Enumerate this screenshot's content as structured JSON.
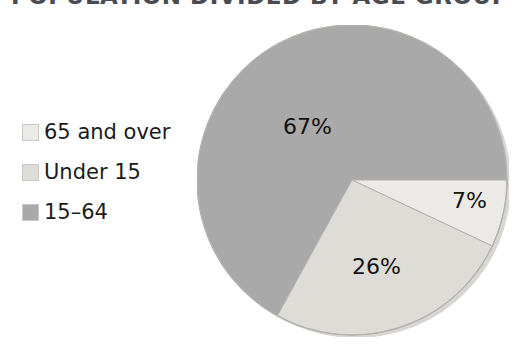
{
  "title": "POPULATION DIVIDED BY AGE GROUP",
  "colors": {
    "slice_65_and_over": "#eceae6",
    "slice_under_15": "#dedcd7",
    "slice_15_64": "#a9a9a9",
    "outline": "#b4b2ad",
    "shadow": "#d8d6d2",
    "label_text": "#111111",
    "legend_text": "#1b1b1b",
    "title_text": "#4a4a52",
    "background": "#ffffff"
  },
  "legend": {
    "items": [
      {
        "label": "65 and over",
        "color": "#eceae6"
      },
      {
        "label": "Under 15",
        "color": "#dedcd7"
      },
      {
        "label": "15–64",
        "color": "#a9a9a9"
      }
    ]
  },
  "labels": {
    "l65": "7%",
    "l15_64": "67%",
    "lunder15": "26%"
  },
  "chart_data": {
    "type": "pie",
    "title": "POPULATION DIVIDED BY AGE GROUP",
    "categories": [
      "65 and over",
      "Under 15",
      "15–64"
    ],
    "values": [
      7,
      26,
      67
    ],
    "value_labels": [
      "7%",
      "26%",
      "67%"
    ],
    "unit": "percent",
    "colors": [
      "#eceae6",
      "#dedcd7",
      "#a9a9a9"
    ],
    "legend_position": "left",
    "grid": false,
    "start_angle_deg": 0,
    "direction": "clockwise",
    "slice_angles_deg": [
      {
        "name": "65 and over",
        "start": 0,
        "end": 25.2
      },
      {
        "name": "Under 15",
        "start": 25.2,
        "end": 118.8
      },
      {
        "name": "15–64",
        "start": 118.8,
        "end": 360
      }
    ]
  }
}
